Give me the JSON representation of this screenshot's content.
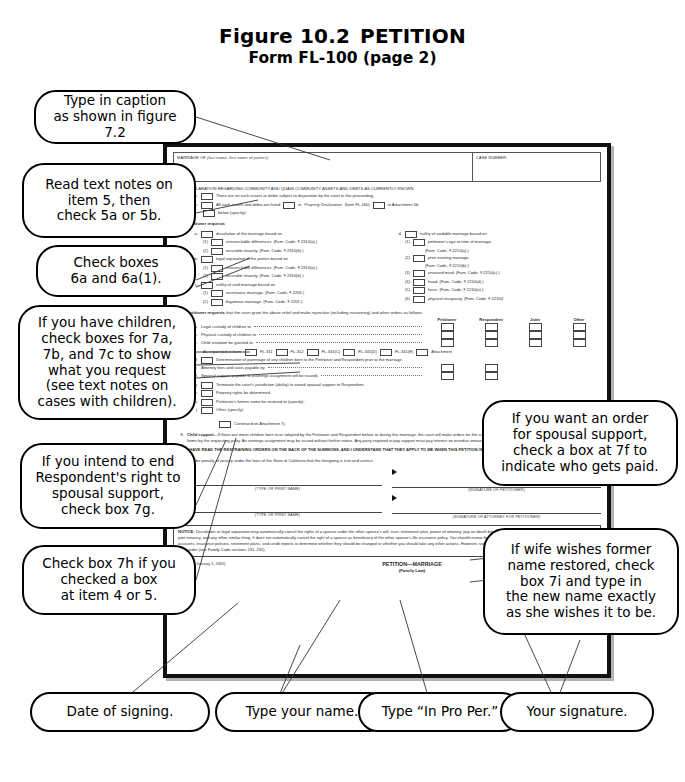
{
  "figure": {
    "number": "Figure 10.2",
    "title": "PETITION",
    "subtitle": "Form FL-100 (page 2)"
  },
  "callouts": [
    {
      "id": "caption",
      "text": "Type in caption\nas shown in figure 7.2"
    },
    {
      "id": "item5",
      "text": "Read text notes on\nitem 5, then\ncheck 5a or 5b."
    },
    {
      "id": "item6",
      "text": "Check boxes\n6a and 6a(1)."
    },
    {
      "id": "children",
      "text": "If you have children,\ncheck boxes for 7a,\n7b, and 7c to show\nwhat you request\n(see text notes on\ncases with children)."
    },
    {
      "id": "terminate",
      "text": "If you intend to end\nRespondent's right to\nspousal support,\ncheck box 7g."
    },
    {
      "id": "property",
      "text": "Check box 7h if you\nchecked a box\nat item 4 or 5."
    },
    {
      "id": "spousal",
      "text": "If you want an order\nfor spousal support,\ncheck a box at 7f to\nindicate who gets paid."
    },
    {
      "id": "formername",
      "text": "If wife wishes former\nname restored, check\nbox 7i and type in\nthe new name exactly\nas she wishes it to be."
    },
    {
      "id": "date",
      "text": "Date of signing."
    },
    {
      "id": "typename",
      "text": "Type your name."
    },
    {
      "id": "inpropper",
      "text": "Type “In Pro Per.”"
    },
    {
      "id": "signature",
      "text": "Your signature."
    }
  ],
  "form": {
    "caption": {
      "marriage_label": "MARRIAGE OF (last name, first name of parties):",
      "marriage_label_plain": "MARRIAGE OF",
      "marriage_label_italic": "(last name, first name of parties):",
      "case_number_label": "CASE NUMBER:"
    },
    "item5": {
      "number": "5.",
      "heading": "DECLARATION REGARDING COMMUNITY AND QUASI-COMMUNITY ASSETS AND DEBTS AS CURRENTLY KNOWN",
      "a_letter": "a.",
      "a_text": "There are no such assets or debts subject to disposition by the court in this proceeding.",
      "b_letter": "b.",
      "b_text_1": "All such assets and debts are listed",
      "b_text_2": "in",
      "b_text_2_italic": "Property Declaration",
      "b_text_3": "(form FL-160)",
      "b_text_4": "in Attachment 5b.",
      "b_text_5": "below (specify):"
    },
    "item6": {
      "number": "6.",
      "heading": "Petitioner requests",
      "a_letter": "a.",
      "a_text": "dissolution of the marriage based on",
      "a1_num": "(1)",
      "a1_text": "irreconcilable differences. (Fam. Code, § 2310(a).)",
      "a2_num": "(2)",
      "a2_text": "incurable insanity. (Fam. Code, § 2310(b).)",
      "b_letter": "b.",
      "b_text": "legal separation of the parties based on",
      "b1_num": "(1)",
      "b1_text": "irreconcilable differences. (Fam. Code, § 2310(a).)",
      "b2_num": "(2)",
      "b2_text": "incurable insanity. (Fam. Code, § 2310(b).)",
      "c_letter": "c.",
      "c_text": "nullity of void marriage based on",
      "c1_num": "(1)",
      "c1_text": "incestuous marriage. (Fam. Code, § 2200.)",
      "c2_num": "(2)",
      "c2_text": "bigamous marriage. (Fam. Code, § 2201.)",
      "d_letter": "d.",
      "d_text": "nullity of voidable marriage based on",
      "d1_num": "(1)",
      "d1_text": "petitioner's age at time of marriage.",
      "d1_text2": "(Fam. Code, § 2210(a).)",
      "d2_num": "(2)",
      "d2_text": "prior existing marriage.",
      "d2_text2": "(Fam. Code, § 2210(b).)",
      "d3_num": "(3)",
      "d3_text": "unsound mind. (Fam. Code, § 2210(c).)",
      "d4_num": "(4)",
      "d4_text": "fraud. (Fam. Code, § 2210(d).)",
      "d5_num": "(5)",
      "d5_text": "force. (Fam. Code, § 2210(e).)",
      "d6_num": "(6)",
      "d6_text": "physical incapacity. (Fam. Code, § 2210(f"
    },
    "item7": {
      "number": "7.",
      "heading_bold": "Petitioner requests",
      "heading_rest": "that the court grant the above relief and make injunctive (including restraining) and other orders as follows:",
      "columns": [
        "Petitioner",
        "Respondent",
        "Joint",
        "Other"
      ],
      "rows": [
        {
          "letter": "a.",
          "text": "Legal custody of children to"
        },
        {
          "letter": "b.",
          "text": "Physical custody of children to"
        },
        {
          "letter": "c.",
          "text": "Child visitation be granted to"
        }
      ],
      "as_requested_label": "As requested in form:",
      "forms": [
        "FL-311",
        "FL-312",
        "FL-341(C)",
        "FL-341(D)",
        "FL-341(E)",
        "Attachment"
      ],
      "d_letter": "d.",
      "d_text": "Determination of parentage of any children born to the Petitioner and Respondent prior to the marriage.",
      "e_letter": "e.",
      "e_text": "Attorney fees and costs payable by",
      "f_letter": "f.",
      "f_text": "Spousal support payable to (earnings assignment will be issued)",
      "g_letter": "g.",
      "g_text": "Terminate the court's jurisdiction (ability) to award spousal support to Respondent.",
      "h_letter": "h.",
      "h_text": "Property rights be determined.",
      "i_letter": "i.",
      "i_text": "Petitioner's former name be restored to (specify):",
      "j_letter": "j.",
      "j_text": "Other (specify):",
      "continued": "Continued on Attachment 7j."
    },
    "item8": {
      "number": "8.",
      "heading": "Child support",
      "text": "—If there are minor children born to or adopted by the Petitioner and Respondent before or during this marriage, the court will make orders for the support of the children upon request and submission of financial forms by the requesting party. An earnings assignment may be issued without further notice. Any party required to pay support must pay interest on overdue amounts at the “legal” rate, which is currently 10 percent."
    },
    "item9": {
      "number": "9.",
      "text": "I HAVE READ THE RESTRAINING ORDERS ON THE BACK OF THE SUMMONS, AND I UNDERSTAND THAT THEY APPLY TO ME WHEN THIS PETITION IS FILED."
    },
    "declaration": "I declare under penalty of perjury under the laws of the State of California that the foregoing is true and correct.",
    "signatures": {
      "date_label": "Date:",
      "type_print_name": "(TYPE OR PRINT NAME)",
      "sig_petitioner": "(SIGNATURE OF PETITIONER)",
      "sig_attorney": "(SIGNATURE OF ATTORNEY FOR PETITIONER)"
    },
    "notice": {
      "label": "NOTICE:",
      "text": " Dissolution or legal separation may automatically cancel the rights of a spouse under the other spouse's will, trust, retirement plan, power of attorney, pay on death bank account, survivorship rights to any property owned in joint tenancy, and any other similar thing. It does not automatically cancel the right of a spouse as beneficiary of the other spouse's life insurance policy. You should review these matters, as well as any credit cards, other credit accounts, insurance policies, retirement plans, and credit reports to determine whether they should be changed or whether you should take any other actions. However, some changes may require the agreement of your spouse or a court order (see Family Code sections 231–235)."
    },
    "footer": {
      "left": "FL-100 [Rev. January 1, 2005]",
      "center": "PETITION—MARRIAGE",
      "center_sub": "(Family Law)",
      "right": "Page 2 of 2"
    }
  },
  "colors": {
    "ink": "#000000",
    "paper": "#ffffff",
    "form_text": "#2a2a2a",
    "rule": "#555555"
  }
}
